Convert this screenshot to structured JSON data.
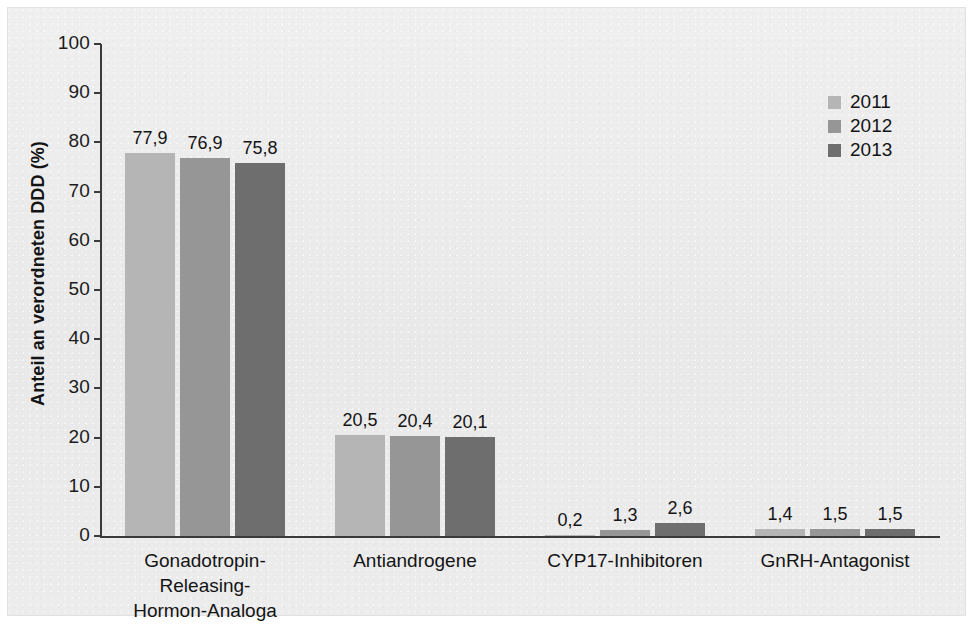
{
  "chart_data": {
    "type": "bar",
    "title": "",
    "xlabel": "",
    "ylabel": "Anteil an verordneten DDD (%)",
    "ylim": [
      0,
      100
    ],
    "yticks": [
      0,
      10,
      20,
      30,
      40,
      50,
      60,
      70,
      80,
      90,
      100
    ],
    "ytick_labels": [
      "0",
      "10",
      "20",
      "30",
      "40",
      "50",
      "60",
      "70",
      "80",
      "90",
      "100"
    ],
    "grid": false,
    "legend_position": "top-right",
    "categories": [
      "Gonadotropin-Releasing-\nHormon-Analoga",
      "Antiandrogene",
      "CYP17-Inhibitoren",
      "GnRH-Antagonist"
    ],
    "series": [
      {
        "name": "2011",
        "color": "#b5b5b5",
        "values": [
          77.9,
          20.5,
          0.2,
          1.4
        ],
        "labels": [
          "77,9",
          "20,5",
          "0,2",
          "1,4"
        ]
      },
      {
        "name": "2012",
        "color": "#969696",
        "values": [
          76.9,
          20.4,
          1.3,
          1.5
        ],
        "labels": [
          "76,9",
          "20,4",
          "1,3",
          "1,5"
        ]
      },
      {
        "name": "2013",
        "color": "#6e6e6e",
        "values": [
          75.8,
          20.1,
          2.6,
          1.5
        ],
        "labels": [
          "75,8",
          "20,1",
          "2,6",
          "1,5"
        ]
      }
    ]
  },
  "colors": {
    "background": "#ececed",
    "axis": "#3a3a3a",
    "text": "#141414",
    "series_2011": "#b5b5b5",
    "series_2012": "#969696",
    "series_2013": "#6e6e6e"
  }
}
